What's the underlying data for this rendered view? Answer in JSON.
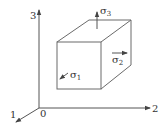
{
  "diagram": {
    "title": "",
    "axes": [
      {
        "id": "axis-1",
        "label": "1"
      },
      {
        "id": "axis-2",
        "label": "2"
      },
      {
        "id": "axis-3",
        "label": "3"
      }
    ],
    "origin_label": "0",
    "stresses": [
      {
        "id": "sigma-1",
        "symbol": "σ",
        "subscript": "1"
      },
      {
        "id": "sigma-2",
        "symbol": "σ",
        "subscript": "2"
      },
      {
        "id": "sigma-3",
        "symbol": "σ",
        "subscript": "3"
      }
    ],
    "colors": {
      "lines": "#6a6a6a",
      "text": "#333333",
      "background": "#ffffff"
    }
  }
}
